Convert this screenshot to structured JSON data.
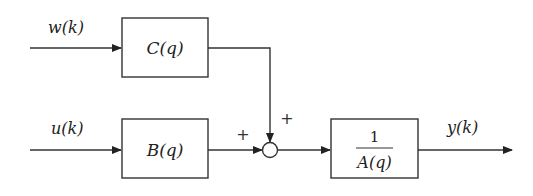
{
  "diagram": {
    "type": "block-diagram",
    "inputs": {
      "w": "w(k)",
      "u": "u(k)"
    },
    "blocks": {
      "c": {
        "label": "C(q)"
      },
      "b": {
        "label": "B(q)"
      },
      "a": {
        "numerator": "1",
        "denominator": "A(q)"
      }
    },
    "summing_junction": {
      "sign_left": "+",
      "sign_top": "+"
    },
    "output": "y(k)",
    "colors": {
      "line": "#333333",
      "background": "#ffffff"
    }
  }
}
